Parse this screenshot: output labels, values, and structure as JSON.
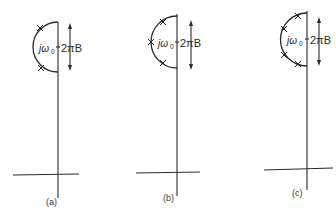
{
  "figure": {
    "panels": [
      {
        "id": "a",
        "caption": "(a)",
        "omega_label": "jω",
        "omega_sub": "0",
        "bandwidth_label": "2πB",
        "pole_count": 2
      },
      {
        "id": "b",
        "caption": "(b)",
        "omega_label": "jω",
        "omega_sub": "0",
        "bandwidth_label": "2πB",
        "pole_count": 3
      },
      {
        "id": "c",
        "caption": "(c)",
        "omega_label": "jω",
        "omega_sub": "0",
        "bandwidth_label": "2πB",
        "pole_count": 4
      }
    ],
    "colors": {
      "ink": "#2a2a2a",
      "background": "#ffffff"
    }
  }
}
